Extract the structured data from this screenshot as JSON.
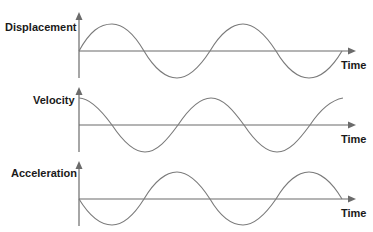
{
  "diagram": {
    "type": "motion-graphs",
    "panels": [
      {
        "label": "Displacement",
        "x_label": "Time",
        "waveform": "sine",
        "phase": "starts at zero, rising"
      },
      {
        "label": "Velocity",
        "x_label": "Time",
        "waveform": "cosine",
        "phase": "starts at maximum"
      },
      {
        "label": "Acceleration",
        "x_label": "Time",
        "waveform": "negative sine",
        "phase": "starts at zero, falling"
      }
    ]
  },
  "colors": {
    "axis": "#6b6b6b",
    "curve": "#7a7a7a",
    "text": "#1a1a1a"
  }
}
